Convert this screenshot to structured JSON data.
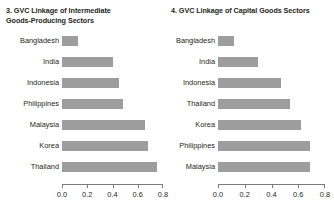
{
  "chart_data": [
    {
      "type": "bar",
      "orientation": "horizontal",
      "panel_number": "3.",
      "title": "3. GVC Linkage of Intermediate Goods-Producing Sectors",
      "title_line1": "3. GVC Linkage of Intermediate",
      "title_line2": "Goods-Producing Sectors",
      "xlabel": "",
      "ylabel": "",
      "categories": [
        "Bangladesh",
        "India",
        "Indonesia",
        "Philippines",
        "Malaysia",
        "Korea",
        "Thailand"
      ],
      "values": [
        0.13,
        0.4,
        0.45,
        0.48,
        0.66,
        0.68,
        0.75
      ],
      "xlim": [
        0.0,
        0.8
      ],
      "xticks": [
        0.0,
        0.2,
        0.4,
        0.6,
        0.8
      ],
      "xticklabels": [
        "0.0",
        "0.2",
        "0.4",
        "0.6",
        "0.8"
      ],
      "grid": false,
      "legend": false,
      "bar_color": "#9d9d9d"
    },
    {
      "type": "bar",
      "orientation": "horizontal",
      "panel_number": "4.",
      "title": "4. GVC Linkage of Capital Goods Sectors",
      "title_line1": "4. GVC Linkage of Capital Goods Sectors",
      "title_line2": "",
      "xlabel": "",
      "ylabel": "",
      "categories": [
        "Bangladesh",
        "India",
        "Indonesia",
        "Thailand",
        "Korea",
        "Philippines",
        "Malaysia"
      ],
      "values": [
        0.12,
        0.3,
        0.47,
        0.54,
        0.62,
        0.69,
        0.685
      ],
      "xlim": [
        0.0,
        0.8
      ],
      "xticks": [
        0.0,
        0.2,
        0.4,
        0.6,
        0.8
      ],
      "xticklabels": [
        "0.0",
        "0.2",
        "0.4",
        "0.6",
        "0.8"
      ],
      "grid": false,
      "legend": false,
      "bar_color": "#9d9d9d"
    }
  ]
}
